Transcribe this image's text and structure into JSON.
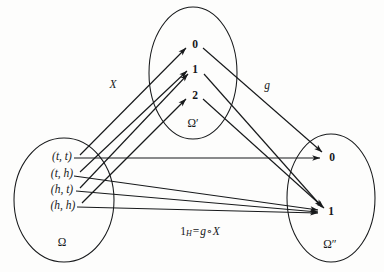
{
  "figure": {
    "kind": "commutative-diagram",
    "caption_formula": {
      "lead": "1",
      "subscript": "H",
      "equals": "=",
      "composite_outer": "g",
      "compose_symbol": "∘",
      "composite_inner": "X",
      "plain": "1_H = g ∘ X"
    }
  },
  "sets": {
    "domain": {
      "label": "Ω",
      "label_x": 62,
      "label_y": 243,
      "ellipse": {
        "cx": 64,
        "cy": 200,
        "rx": 50,
        "ry": 62
      },
      "elements": [
        {
          "id": "tt",
          "label": "(t, t)",
          "x": 62,
          "y": 157
        },
        {
          "id": "th",
          "label": "(t, h)",
          "x": 62,
          "y": 174
        },
        {
          "id": "ht",
          "label": "(h, t)",
          "x": 62,
          "y": 190
        },
        {
          "id": "hh",
          "label": "(h, h)",
          "x": 63,
          "y": 206
        }
      ]
    },
    "middle": {
      "label": "Ω′",
      "label_x": 193,
      "label_y": 124,
      "ellipse": {
        "cx": 193,
        "cy": 73,
        "rx": 44,
        "ry": 66
      },
      "elements": [
        {
          "id": "m0",
          "label": "0",
          "x": 195,
          "y": 45
        },
        {
          "id": "m1",
          "label": "1",
          "x": 195,
          "y": 70
        },
        {
          "id": "m2",
          "label": "2",
          "x": 195,
          "y": 96
        }
      ]
    },
    "codomain": {
      "label": "Ω″",
      "label_x": 330,
      "label_y": 245,
      "ellipse": {
        "cx": 331,
        "cy": 198,
        "rx": 44,
        "ry": 64
      },
      "elements": [
        {
          "id": "c0",
          "label": "0",
          "x": 332,
          "y": 158
        },
        {
          "id": "c1",
          "label": "1",
          "x": 331,
          "y": 212
        }
      ]
    }
  },
  "maps": {
    "X": {
      "label": "X",
      "label_x": 113,
      "label_y": 85,
      "arrows": [
        {
          "from": "tt",
          "to": "m0",
          "x1": 80,
          "y1": 155,
          "x2": 186,
          "y2": 48
        },
        {
          "from": "th",
          "to": "m1",
          "x1": 80,
          "y1": 172,
          "x2": 187,
          "y2": 71
        },
        {
          "from": "ht",
          "to": "m1",
          "x1": 80,
          "y1": 188,
          "x2": 188,
          "y2": 74
        },
        {
          "from": "hh",
          "to": "m2",
          "x1": 82,
          "y1": 203,
          "x2": 186,
          "y2": 99
        }
      ]
    },
    "g": {
      "label": "g",
      "label_x": 267,
      "label_y": 86,
      "arrows": [
        {
          "from": "m0",
          "to": "c0",
          "x1": 203,
          "y1": 48,
          "x2": 322,
          "y2": 152
        },
        {
          "from": "m1",
          "to": "c1",
          "x1": 204,
          "y1": 74,
          "x2": 322,
          "y2": 207
        },
        {
          "from": "m2",
          "to": "c1",
          "x1": 203,
          "y1": 99,
          "x2": 324,
          "y2": 208
        }
      ]
    },
    "identity": {
      "label": "1_H",
      "arrows": [
        {
          "from": "tt",
          "to": "c0",
          "x1": 74,
          "y1": 158,
          "x2": 320,
          "y2": 158
        },
        {
          "from": "th",
          "to": "c1",
          "x1": 74,
          "y1": 176,
          "x2": 318,
          "y2": 210
        },
        {
          "from": "ht",
          "to": "c1",
          "x1": 76,
          "y1": 191,
          "x2": 318,
          "y2": 212
        },
        {
          "from": "hh",
          "to": "c1",
          "x1": 77,
          "y1": 207,
          "x2": 318,
          "y2": 213
        }
      ]
    }
  }
}
